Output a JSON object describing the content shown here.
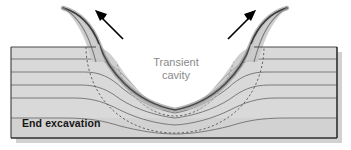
{
  "figure": {
    "title": "End excavation",
    "kind": "impact-crater-cross-section",
    "labels": {
      "stage": "End excavation",
      "cavity_line1": "Transient",
      "cavity_line2": "cavity"
    },
    "arrows": {
      "left": {
        "name": "ejecta-arrow-left",
        "direction": "up-left"
      },
      "right": {
        "name": "ejecta-arrow-right",
        "direction": "up-right"
      }
    },
    "colors": {
      "background": "#ffffff",
      "block_fill": "#d8d8d8",
      "block_fill_light": "#e2e2e2",
      "block_shadow": "#b9b9b9",
      "block_edge": "#3a3a3a",
      "layer_line": "#6e6e6e",
      "cavity_fill": "#ffffff",
      "cavity_rim": "#4a4a4a",
      "cavity_rim_inner": "#9a9a9a",
      "dashed_arc": "#4d4d4d",
      "arrow": "#000000",
      "label_cavity_text": "#8a8a8a",
      "label_stage_text": "#161616",
      "rim_shade": "#c2c2c2"
    },
    "geometry": {
      "block_left": 11,
      "block_right": 337,
      "surface_y": 47,
      "block_bottom": 138,
      "cavity_center_x": 175,
      "cavity_depth_y": 112,
      "layer_count": 5
    },
    "layers": [
      {
        "name": "layer-1",
        "y": 59
      },
      {
        "name": "layer-2",
        "y": 72
      },
      {
        "name": "layer-3",
        "y": 85
      },
      {
        "name": "layer-4",
        "y": 98
      },
      {
        "name": "layer-5",
        "y": 118
      }
    ],
    "dashed_arcs": [
      {
        "name": "excavation-stage-arc-inner",
        "half_width": 60,
        "depth": 78
      },
      {
        "name": "excavation-stage-arc-outer",
        "half_width": 90,
        "depth": 92
      }
    ]
  }
}
